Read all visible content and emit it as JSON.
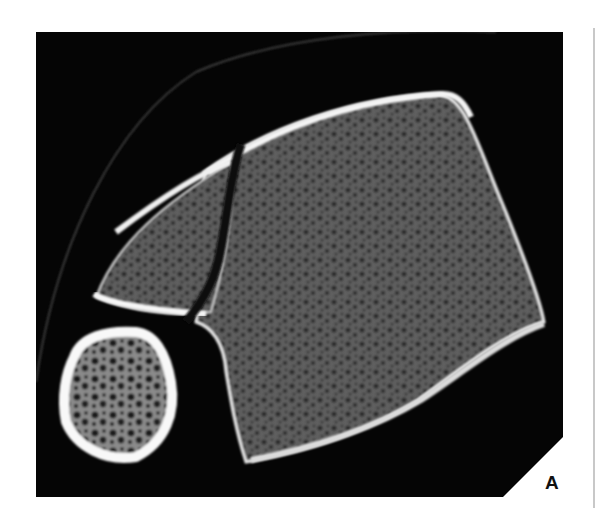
{
  "figure": {
    "panel_label": "A",
    "colors": {
      "background": "#050505",
      "cortex": "#f2f2f2",
      "trabecular": "#5a5a5a",
      "page": "#ffffff"
    }
  }
}
